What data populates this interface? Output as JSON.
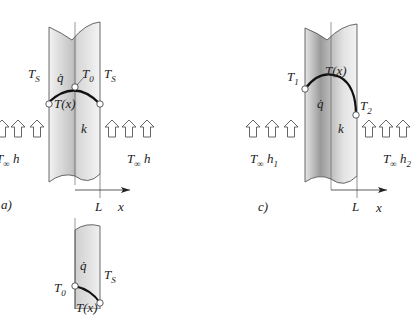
{
  "figure": {
    "panels": [
      {
        "id": "a",
        "label": "a)",
        "labels": {
          "ts_left": "T",
          "ts_left_sub": "S",
          "ts_right": "T",
          "ts_right_sub": "S",
          "qdot": "q̇",
          "t0": "T",
          "t0_sub": "0",
          "tx": "T(x)",
          "k": "k",
          "fluid_left": "T",
          "fluid_left_sub": "∞",
          "fluid_left_h": "h",
          "fluid_right": "T",
          "fluid_right_sub": "∞",
          "fluid_right_h": "h",
          "axis_L": "L",
          "axis_x": "x"
        }
      },
      {
        "id": "b",
        "labels": {
          "qdot": "q̇",
          "ts": "T",
          "ts_sub": "S",
          "t0": "T",
          "t0_sub": "0",
          "tx": "T(x)"
        }
      },
      {
        "id": "c",
        "label": "c)",
        "labels": {
          "t1": "T",
          "t1_sub": "1",
          "tx": "T(x)",
          "qdot": "q̇",
          "t2": "T",
          "t2_sub": "2",
          "k": "k",
          "fluid_left": "T",
          "fluid_left_sub": "∞",
          "fluid_left_h": "h",
          "fluid_left_h_sub": "1",
          "fluid_right": "T",
          "fluid_right_sub": "∞",
          "fluid_right_h": "h",
          "fluid_right_h_sub": "2",
          "axis_L": "L",
          "axis_x": "x"
        }
      }
    ],
    "colors": {
      "wall_dark": "#8a8a8a",
      "wall_light": "#ececec",
      "line": "#222222",
      "arrow_outline": "#555555"
    }
  }
}
